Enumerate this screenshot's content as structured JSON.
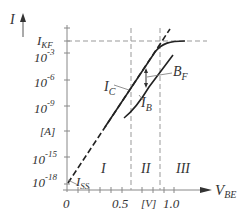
{
  "diagram": {
    "y_axis": {
      "label": "I",
      "unit": "[A]",
      "ticks": [
        "I_KF",
        "10^-3",
        "10^-6",
        "10^-9",
        "[A]",
        "10^-15",
        "10^-18"
      ],
      "tick_labels": {
        "ikf_main": "I",
        "ikf_sub": "KF",
        "t3_base": "10",
        "t3_exp": "-3",
        "t6_base": "10",
        "t6_exp": "-6",
        "t9_base": "10",
        "t9_exp": "-9",
        "unit": "[A]",
        "t15_base": "10",
        "t15_exp": "-15",
        "t18_base": "10",
        "t18_exp": "-18"
      }
    },
    "x_axis": {
      "label_main": "V",
      "label_sub": "BE",
      "ticks": [
        "0",
        "0.5",
        "[V]",
        "1.0"
      ]
    },
    "curves": {
      "ic": {
        "main": "I",
        "sub": "C"
      },
      "ib": {
        "main": "I",
        "sub": "B"
      },
      "bf": {
        "main": "B",
        "sub": "F"
      },
      "iss": {
        "main": "I",
        "sub": "SS"
      }
    },
    "regions": [
      "I",
      "II",
      "III"
    ],
    "colors": {
      "curve": "#222222",
      "axis": "#777777",
      "dash": "#999999",
      "text": "#333333"
    }
  }
}
